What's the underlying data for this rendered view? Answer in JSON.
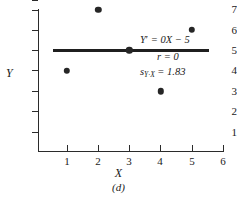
{
  "chart_data": {
    "type": "scatter",
    "title": "",
    "xlabel": "X",
    "ylabel": "Y",
    "caption": "(d)",
    "x": [
      1,
      2,
      3,
      4,
      5
    ],
    "values": [
      4,
      7,
      5,
      3,
      6
    ],
    "points": [
      {
        "x": 1,
        "y": 4
      },
      {
        "x": 2,
        "y": 7
      },
      {
        "x": 3,
        "y": 5
      },
      {
        "x": 4,
        "y": 3
      },
      {
        "x": 5,
        "y": 6
      }
    ],
    "xlim": [
      0.5,
      6.4
    ],
    "ylim": [
      0.3,
      7.4
    ],
    "xticks": [
      "1",
      "2",
      "3",
      "4",
      "5",
      "6"
    ],
    "yticks": [
      "1",
      "2",
      "3",
      "4",
      "5",
      "6",
      "7"
    ],
    "grid": false,
    "legend": "none",
    "fit_line": {
      "slope": 0,
      "intercept": 5,
      "x_start": 0.55,
      "x_end": 5.55,
      "y": 5
    },
    "annotations": {
      "equation_lhs": "Y",
      "equation_prime": "′",
      "equation_rhs": " = 0X − 5",
      "correlation": "r = 0",
      "stderr_symbol": "s",
      "stderr_subscript": "Y·X",
      "stderr_value": " = 1.83"
    }
  }
}
